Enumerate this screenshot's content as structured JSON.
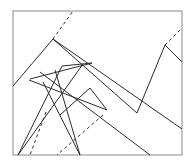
{
  "figure": {
    "width": 196,
    "height": 168,
    "background_color": "#ffffff",
    "stroke_color": "#2b2b2b",
    "frame_color": "#8a8a8a",
    "frame": {
      "x": 13,
      "y": 11,
      "width": 169,
      "height": 144
    },
    "dash_pattern": "3 3",
    "solid_paths": [
      {
        "name": "left-peak-ridge",
        "points": "13,86 53,39 137,113"
      },
      {
        "name": "right-peak-ridge",
        "points": "137,113 165,45 182,62"
      },
      {
        "name": "long-descending-diagonal",
        "points": "53,39 182,129"
      },
      {
        "name": "lower-descending-diagonal",
        "points": "40,72 150,155"
      },
      {
        "name": "mid-zigzag-peak",
        "points": "60,115 90,88 107,110"
      },
      {
        "name": "star-fan-left",
        "points": "18,155 62,66"
      },
      {
        "name": "star-fan-center",
        "points": "18,155 83,64"
      },
      {
        "name": "star-fan-right",
        "points": "80,155 55,70"
      },
      {
        "name": "star-fan-far-right",
        "points": "80,155 43,82"
      },
      {
        "name": "star-crossbar-upper",
        "points": "30,79 92,63"
      },
      {
        "name": "star-crossbar-lower",
        "points": "29,80 107,110"
      },
      {
        "name": "star-apex-link",
        "points": "62,66 92,63"
      }
    ],
    "dashed_paths": [
      {
        "name": "upper-left-dashed-ray",
        "points": "53,39 73,11"
      },
      {
        "name": "upper-right-dashed-ray",
        "points": "165,45 182,28"
      },
      {
        "name": "lower-left-dashed-ray",
        "points": "46,112 30,155"
      },
      {
        "name": "lower-center-dashed-ray",
        "points": "103,115 57,155"
      }
    ]
  }
}
